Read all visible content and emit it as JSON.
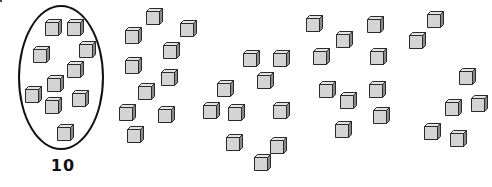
{
  "figure": {
    "circled_group_label": "10",
    "colors": {
      "cube_front": "#d4d4d4",
      "cube_top": "#e4e4e4",
      "cube_side": "#8a8a8a",
      "cube_outline": "#2a2a2a",
      "ellipse_stroke": "#111111"
    },
    "groups": [
      {
        "name": "group-1-circled",
        "count": 10,
        "cubes": [
          [
            45,
            22
          ],
          [
            67,
            22
          ],
          [
            79,
            44
          ],
          [
            33,
            49
          ],
          [
            67,
            64
          ],
          [
            47,
            78
          ],
          [
            25,
            89
          ],
          [
            45,
            100
          ],
          [
            72,
            93
          ],
          [
            57,
            127
          ]
        ]
      },
      {
        "name": "group-2",
        "count": 10,
        "cubes": [
          [
            146,
            11
          ],
          [
            180,
            23
          ],
          [
            125,
            30
          ],
          [
            163,
            45
          ],
          [
            125,
            60
          ],
          [
            161,
            72
          ],
          [
            138,
            86
          ],
          [
            119,
            107
          ],
          [
            158,
            109
          ],
          [
            127,
            129
          ]
        ]
      },
      {
        "name": "group-3",
        "count": 10,
        "cubes": [
          [
            243,
            53
          ],
          [
            273,
            53
          ],
          [
            217,
            83
          ],
          [
            257,
            75
          ],
          [
            203,
            105
          ],
          [
            228,
            107
          ],
          [
            273,
            105
          ],
          [
            226,
            137
          ],
          [
            270,
            140
          ],
          [
            254,
            157
          ]
        ]
      },
      {
        "name": "group-4",
        "count": 10,
        "cubes": [
          [
            306,
            18
          ],
          [
            336,
            34
          ],
          [
            367,
            19
          ],
          [
            313,
            51
          ],
          [
            370,
            51
          ],
          [
            319,
            84
          ],
          [
            340,
            95
          ],
          [
            369,
            84
          ],
          [
            373,
            110
          ],
          [
            335,
            124
          ]
        ]
      },
      {
        "name": "group-5",
        "count": 7,
        "cubes": [
          [
            427,
            14
          ],
          [
            409,
            35
          ],
          [
            459,
            71
          ],
          [
            445,
            102
          ],
          [
            471,
            98
          ],
          [
            424,
            126
          ],
          [
            450,
            133
          ]
        ]
      }
    ],
    "total_cubes": 47
  }
}
